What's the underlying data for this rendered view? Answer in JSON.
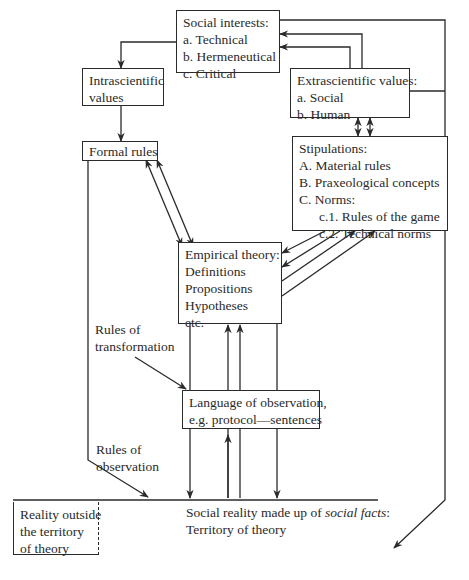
{
  "diagram": {
    "social_interests": {
      "title": "Social interests:",
      "items": [
        "a.  Technical",
        "b.  Hermeneutical",
        "c.  Critical"
      ]
    },
    "intrascientific_values": {
      "lines": [
        "Intrascientific",
        "values"
      ]
    },
    "extrascientific_values": {
      "title": "Extrascientific values:",
      "items": [
        "a.  Social",
        "b.  Human"
      ]
    },
    "formal_rules": {
      "title": "Formal rules"
    },
    "stipulations": {
      "title": "Stipulations:",
      "items": [
        "A.  Material rules",
        "B.  Praxeological concepts",
        "C.  Norms:"
      ],
      "subitems": [
        "c.1.  Rules of the game",
        "c.2.  Technical  norms"
      ]
    },
    "empirical_theory": {
      "title": "Empirical theory:",
      "items": [
        "Definitions",
        "Propositions",
        "Hypotheses",
        "etc."
      ]
    },
    "rules_of_transformation": {
      "lines": [
        "Rules of",
        "transformation"
      ]
    },
    "language_of_observation": {
      "lines": [
        "Language of observation,",
        "e.g. protocol—sentences"
      ]
    },
    "rules_of_observation": {
      "lines": [
        "Rules of",
        "observation"
      ]
    },
    "reality_outside": {
      "lines": [
        "Reality outside",
        "the territory",
        "of theory"
      ]
    },
    "social_reality": {
      "prefix": "Social reality made up of ",
      "italic": "social facts",
      "suffix": ":",
      "line2": "Territory of theory"
    },
    "colors": {
      "ink": "#2a2a2a",
      "background": "#ffffff"
    }
  }
}
